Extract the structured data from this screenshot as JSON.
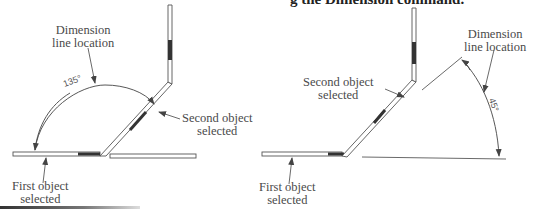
{
  "caption": {
    "partial_text": "g the Dimension command."
  },
  "figure_left": {
    "label_dimension_line": [
      "Dimension",
      "line location"
    ],
    "label_second_object": [
      "Second object",
      "selected"
    ],
    "label_first_object": [
      "First object",
      "selected"
    ],
    "angle_value": "135°"
  },
  "figure_right": {
    "label_dimension_line": [
      "Dimension",
      "line location"
    ],
    "label_second_object": [
      "Second object",
      "selected"
    ],
    "label_first_object": [
      "First object",
      "selected"
    ],
    "angle_value": "45°"
  },
  "colors": {
    "line": "#555555",
    "text": "#4a4a4a",
    "highlight": "#333333"
  }
}
